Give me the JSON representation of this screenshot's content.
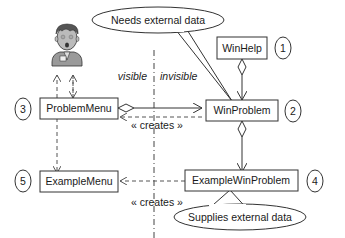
{
  "diagram": {
    "classes": [
      {
        "id": "winhelp",
        "label": "WinHelp",
        "number": "1"
      },
      {
        "id": "winproblem",
        "label": "WinProblem",
        "number": "2"
      },
      {
        "id": "problemmenu",
        "label": "ProblemMenu",
        "number": "3"
      },
      {
        "id": "examplewinproblem",
        "label": "ExampleWinProblem",
        "number": "4"
      },
      {
        "id": "examplemenu",
        "label": "ExampleMenu",
        "number": "5"
      }
    ],
    "callouts": {
      "top": "Needs external data",
      "bottom": "Supplies external data"
    },
    "boundary": {
      "left_label": "visible",
      "right_label": "invisible"
    },
    "relations": [
      {
        "from": "problemmenu",
        "to": "winproblem",
        "type": "aggregation"
      },
      {
        "from": "winproblem",
        "to": "problemmenu",
        "type": "dependency",
        "stereotype": "« creates »"
      },
      {
        "from": "examplewinproblem",
        "to": "examplemenu",
        "type": "dependency",
        "stereotype": "« creates »"
      },
      {
        "from": "winhelp",
        "to": "winproblem",
        "type": "aggregation"
      },
      {
        "from": "winproblem",
        "to": "examplewinproblem",
        "type": "aggregation"
      },
      {
        "from": "problemmenu",
        "to": "examplemenu",
        "type": "dependency"
      },
      {
        "from": "problemmenu",
        "to": "user",
        "type": "dependency"
      }
    ],
    "actor": "user-figure"
  }
}
